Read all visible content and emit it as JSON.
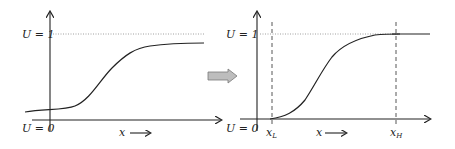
{
  "diagram": {
    "left_panel": {
      "y_top_label": "U = 1",
      "y_bottom_label": "U = 0",
      "x_axis_label": "x",
      "curve_description": "smooth S-shaped curve starting slightly above U=0 and approaching but not reaching U=1"
    },
    "transition_arrow": {
      "description": "gray block arrow pointing right"
    },
    "right_panel": {
      "y_top_label": "U = 1",
      "y_bottom_label": "U = 0",
      "x_axis_label": "x",
      "lower_bound_label": "x",
      "lower_bound_sub": "L",
      "upper_bound_label": "x",
      "upper_bound_sub": "H",
      "curve_description": "S-shaped curve starting at U=0 at x_L and reaching U=1 at x_H"
    },
    "colors": {
      "axis": "#222222",
      "curve": "#222222",
      "dotted_guide": "#888888",
      "arrow_fill": "#bdbdbd",
      "arrow_stroke": "#7a7a7a"
    }
  }
}
